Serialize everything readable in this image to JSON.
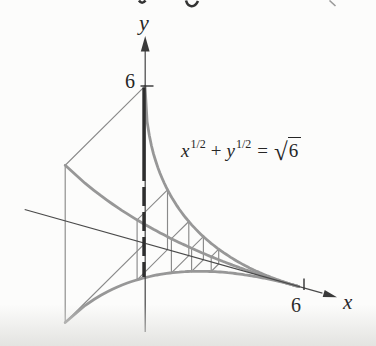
{
  "diagram": {
    "axis_labels": {
      "y": "y",
      "x": "x"
    },
    "tick_labels": {
      "y6": "6",
      "x6": "6"
    },
    "formula": {
      "var1": "x",
      "exp1": "1/2",
      "plus": "+",
      "var2": "y",
      "exp2": "1/2",
      "equals": "=",
      "radical": "√",
      "radicand": "6"
    },
    "colors": {
      "background": "#fcfcfb",
      "thick_curve": "#979797",
      "wireframe": "#8a8a8a",
      "axis": "#4a4a4a",
      "bold_section": "#2e2e2e",
      "text": "#262626"
    },
    "geometry": {
      "note": "axonometric projection of solid with square cross-sections on curve sqrt(x)+sqrt(y)=sqrt(6), 0<=x<=6",
      "origin": [
        145,
        243.3
      ],
      "ux": [
        25.6,
        7.2
      ],
      "uy": [
        0,
        -26.2
      ],
      "uz": [
        -13.3,
        13.2
      ],
      "curve_constant": 6,
      "x_max": 6,
      "station_x": [
        0.88,
        1.71,
        2.28,
        2.88
      ],
      "x_axis_t": [
        -4.7,
        6.93
      ],
      "x_arrow_tip_t": 7.5,
      "y_axis_screen": {
        "col": 145.2,
        "top": 49,
        "bottom": 332,
        "arrow_tip_y": 36
      },
      "bold_bar": {
        "col": 143.9,
        "solid": [
          87.5,
          162
        ],
        "dashed": [
          162,
          277
        ]
      },
      "y_tick": {
        "x1": 140.5,
        "x2": 153.5,
        "y": 86
      },
      "x_tick": {
        "x": 304,
        "y1": 278.5,
        "y2": 290
      },
      "edge_fragments": {
        "hook": "M186,0.5 C188,7.5 194.5,8.5 198,1",
        "dash_mid": "M139,0.5 Q142,5 145.5,0.5",
        "slash_right": "M329.5,0.5 L335.5,6"
      }
    }
  }
}
